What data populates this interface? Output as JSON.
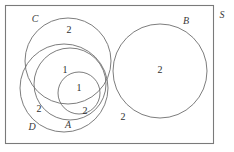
{
  "diagram": {
    "type": "venn",
    "stroke_color": "#6e6e6e",
    "frame_color": "#7a7a7a",
    "text_color": "#2e2e2e",
    "label_color": "#3a3a3a",
    "background": "#ffffff"
  },
  "universe": {
    "label": "S",
    "label_x": 222,
    "label_y": 16,
    "frame": {
      "x": 5.5,
      "y": 5.5,
      "width": 208,
      "height": 138
    }
  },
  "sets": [
    {
      "name": "C",
      "label": "C",
      "label_x": 35,
      "label_y": 20,
      "cx": 68,
      "cy": 61,
      "r": 43
    },
    {
      "name": "middle",
      "label": "",
      "label_x": 0,
      "label_y": 0,
      "cx": 70,
      "cy": 84,
      "r": 36
    },
    {
      "name": "D",
      "label": "D",
      "label_x": 32,
      "label_y": 128,
      "cx": 64,
      "cy": 88,
      "r": 44
    },
    {
      "name": "A",
      "label": "A",
      "label_x": 68,
      "label_y": 126,
      "cx": 79,
      "cy": 93,
      "r": 21
    },
    {
      "name": "B",
      "label": "B",
      "label_x": 186,
      "label_y": 22,
      "cx": 160,
      "cy": 71,
      "r": 47
    }
  ],
  "regions": [
    {
      "name": "region-c-only",
      "value": "2",
      "x": 69,
      "y": 31
    },
    {
      "name": "region-middle-only",
      "value": "1",
      "x": 65,
      "y": 71
    },
    {
      "name": "region-a-inner",
      "value": "1",
      "x": 79,
      "y": 89
    },
    {
      "name": "region-a-d-overlap",
      "value": "2",
      "x": 85,
      "y": 112
    },
    {
      "name": "region-d-only",
      "value": "2",
      "x": 39,
      "y": 110
    },
    {
      "name": "region-b-only",
      "value": "2",
      "x": 160,
      "y": 71
    },
    {
      "name": "region-outside",
      "value": "2",
      "x": 123,
      "y": 118
    }
  ]
}
